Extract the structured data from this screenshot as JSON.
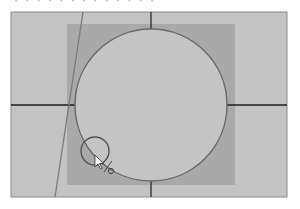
{
  "header": {
    "cropped_text": "· · · · · · · ·   · · · · ·"
  },
  "canvas": {
    "colors": {
      "outer_bg": "#c3c3c3",
      "inner_square": "#a9a9a9",
      "circle_fill": "#c4c4c4",
      "circle_stroke": "#6a6a6a",
      "crosshair": "#1e1e1e",
      "diagonal_line": "#7a7a7a",
      "frame_stroke": "#8a8a8a"
    },
    "tool": "circle-select",
    "snap_marker": "/o"
  }
}
